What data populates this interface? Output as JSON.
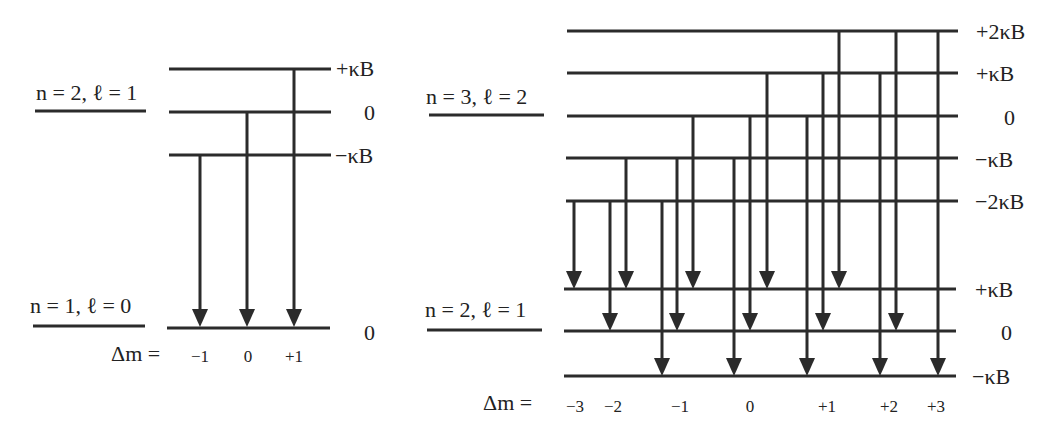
{
  "title_fragment": "",
  "left_diagram": {
    "upper_state_label": "n = 2, ℓ = 1",
    "lower_state_label": "n = 1, ℓ = 0",
    "upper_levels": [
      {
        "label": "+κB",
        "y": 69
      },
      {
        "label": "0",
        "y": 112
      },
      {
        "label": "−κB",
        "y": 155
      }
    ],
    "lower_levels": [
      {
        "label": "0",
        "y": 327
      }
    ],
    "delta_m_prefix": "Δm =",
    "transitions": [
      {
        "x": 200,
        "from": "−κB",
        "to": "0",
        "delta_m": "−1"
      },
      {
        "x": 247,
        "from": "0",
        "to": "0",
        "delta_m": "0"
      },
      {
        "x": 294,
        "from": "+κB",
        "to": "0",
        "delta_m": "+1"
      }
    ],
    "delta_m_labels": [
      {
        "text": "−1",
        "x": 200
      },
      {
        "text": "0",
        "x": 248
      },
      {
        "text": "+1",
        "x": 294
      }
    ]
  },
  "right_diagram": {
    "upper_state_label": "n = 3, ℓ = 2",
    "lower_state_label": "n = 2, ℓ = 1",
    "upper_levels": [
      {
        "label": "+2κB",
        "y": 31
      },
      {
        "label": "+κB",
        "y": 73
      },
      {
        "label": "0",
        "y": 116
      },
      {
        "label": "−κB",
        "y": 158
      },
      {
        "label": "−2κB",
        "y": 201
      }
    ],
    "lower_levels": [
      {
        "label": "+κB",
        "y": 289
      },
      {
        "label": "0",
        "y": 331
      },
      {
        "label": "−κB",
        "y": 375
      }
    ],
    "delta_m_prefix": "Δm =",
    "transitions": [
      {
        "x": 574,
        "from": "−2κB",
        "to": "+κB",
        "delta_m": "−3"
      },
      {
        "x": 610,
        "from": "−2κB",
        "to": "0",
        "delta_m": "−2"
      },
      {
        "x": 626,
        "from": "−κB",
        "to": "+κB",
        "delta_m": "−2"
      },
      {
        "x": 662,
        "from": "−2κB",
        "to": "−κB",
        "delta_m": "−1"
      },
      {
        "x": 677,
        "from": "−κB",
        "to": "0",
        "delta_m": "−1"
      },
      {
        "x": 693,
        "from": "0",
        "to": "+κB",
        "delta_m": "−1"
      },
      {
        "x": 734,
        "from": "−κB",
        "to": "−κB",
        "delta_m": "0"
      },
      {
        "x": 750,
        "from": "0",
        "to": "0",
        "delta_m": "0"
      },
      {
        "x": 767,
        "from": "+κB",
        "to": "+κB",
        "delta_m": "0"
      },
      {
        "x": 807,
        "from": "0",
        "to": "−κB",
        "delta_m": "+1"
      },
      {
        "x": 823,
        "from": "+κB",
        "to": "0",
        "delta_m": "+1"
      },
      {
        "x": 839,
        "from": "+2κB",
        "to": "+κB",
        "delta_m": "+1"
      },
      {
        "x": 880,
        "from": "+κB",
        "to": "−κB",
        "delta_m": "+2"
      },
      {
        "x": 896,
        "from": "+2κB",
        "to": "0",
        "delta_m": "+2"
      },
      {
        "x": 938,
        "from": "+2κB",
        "to": "−κB",
        "delta_m": "+3"
      }
    ],
    "delta_m_labels": [
      {
        "text": "−3",
        "x": 575
      },
      {
        "text": "−2",
        "x": 613
      },
      {
        "text": "−1",
        "x": 680
      },
      {
        "text": "0",
        "x": 750
      },
      {
        "text": "+1",
        "x": 827
      },
      {
        "text": "+2",
        "x": 889
      },
      {
        "text": "+3",
        "x": 936
      }
    ]
  }
}
